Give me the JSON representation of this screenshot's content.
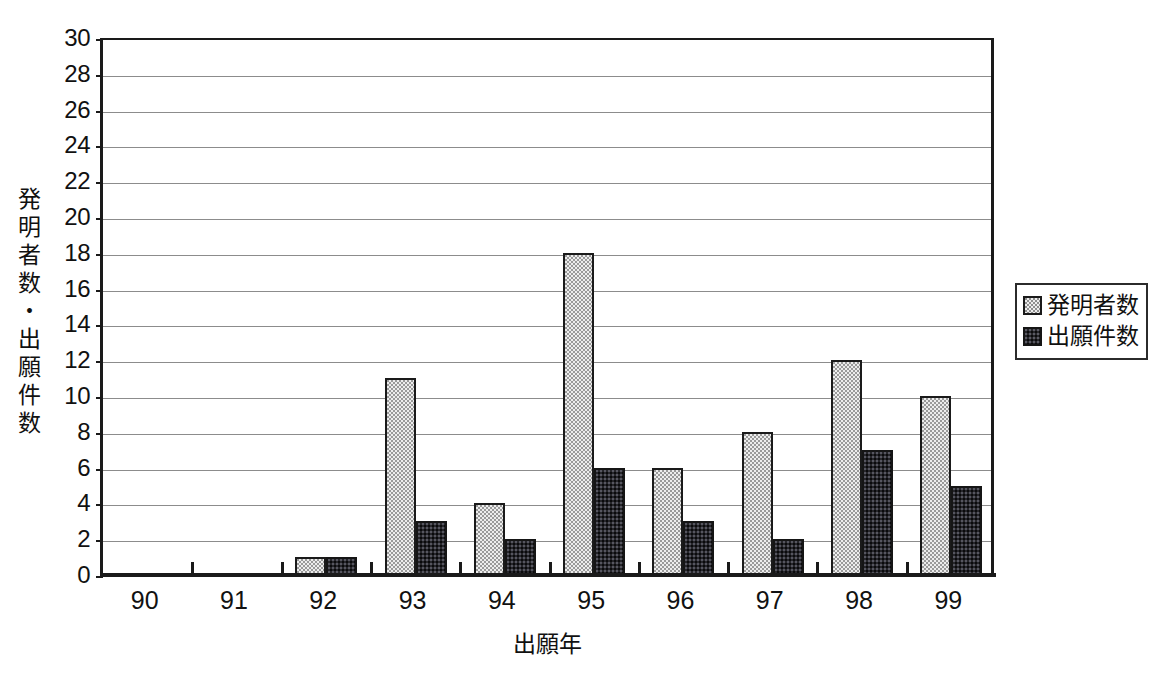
{
  "chart_data": {
    "type": "bar",
    "title": "",
    "subtitle": "",
    "xlabel": "出願年",
    "ylabel": "発明者数・出願件数",
    "categories": [
      "90",
      "91",
      "92",
      "93",
      "94",
      "95",
      "96",
      "97",
      "98",
      "99"
    ],
    "series": [
      {
        "name": "発明者数",
        "fill": "light-dotted",
        "color": "#ededed",
        "values": [
          0,
          0,
          1,
          11,
          4,
          18,
          6,
          8,
          12,
          10
        ]
      },
      {
        "name": "出願件数",
        "fill": "dark-checkered",
        "color": "#26262a",
        "values": [
          0,
          0,
          1,
          3,
          2,
          6,
          3,
          2,
          7,
          5
        ]
      }
    ],
    "ylim": [
      0,
      30
    ],
    "ytick_step": 2,
    "yticks": [
      0,
      2,
      4,
      6,
      8,
      10,
      12,
      14,
      16,
      18,
      20,
      22,
      24,
      26,
      28,
      30
    ],
    "ytick_labels": [
      "0",
      "2",
      "4",
      "6",
      "8",
      "10",
      "12",
      "14",
      "16",
      "18",
      "20",
      "22",
      "24",
      "26",
      "28",
      "30"
    ],
    "grid": true,
    "grid_axis": "y",
    "legend_position": "right",
    "legend_entries": [
      "発明者数",
      "出願件数"
    ],
    "axis_color": "#1a1a1a",
    "grid_color": "#8c8c8c",
    "background": "#ffffff"
  },
  "y_axis_title_chars": [
    "発",
    "明",
    "者",
    "数",
    "・",
    "出",
    "願",
    "件",
    "数"
  ]
}
